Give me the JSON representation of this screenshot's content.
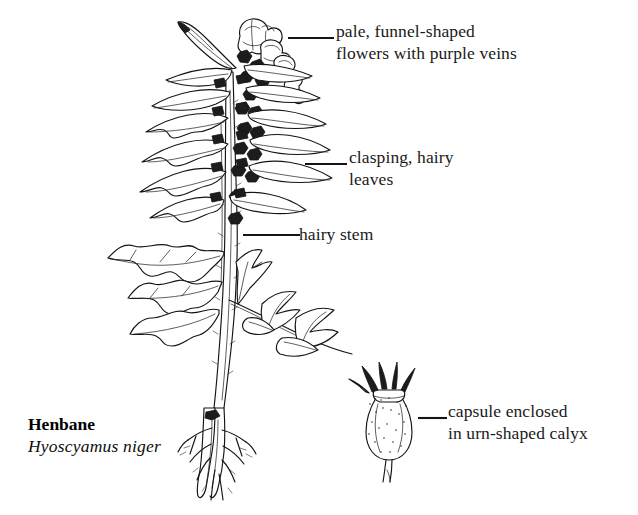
{
  "illustration": {
    "subject": "henbane-plant",
    "style": "black-and-white-line-drawing",
    "background_color": "#ffffff",
    "ink_color": "#111111"
  },
  "caption": {
    "common_name": "Henbane",
    "scientific_name": "Hyoscyamus niger"
  },
  "annotations": [
    {
      "id": "flowers",
      "line1": "pale, funnel-shaped",
      "line2": "flowers with purple veins",
      "points_to": "flower-cluster"
    },
    {
      "id": "leaves",
      "line1": "clasping, hairy",
      "line2": "leaves",
      "points_to": "upper-stem-leaves"
    },
    {
      "id": "stem",
      "line1": "hairy stem",
      "line2": "",
      "points_to": "main-stem"
    },
    {
      "id": "capsule",
      "line1": "capsule enclosed",
      "line2": "in urn-shaped calyx",
      "points_to": "seed-capsule-detail"
    }
  ],
  "parts": {
    "flower_cluster": "flower-cluster",
    "bract": "lance-shaped-bract",
    "upper_leaves": "clasping-hairy-leaves",
    "lower_leaves": "pinnately-lobed-leaves",
    "side_branch": "lateral-leafy-branch",
    "stem": "hairy-main-stem",
    "taproot": "branching-taproot",
    "capsule": "urn-shaped-calyx-capsule"
  }
}
